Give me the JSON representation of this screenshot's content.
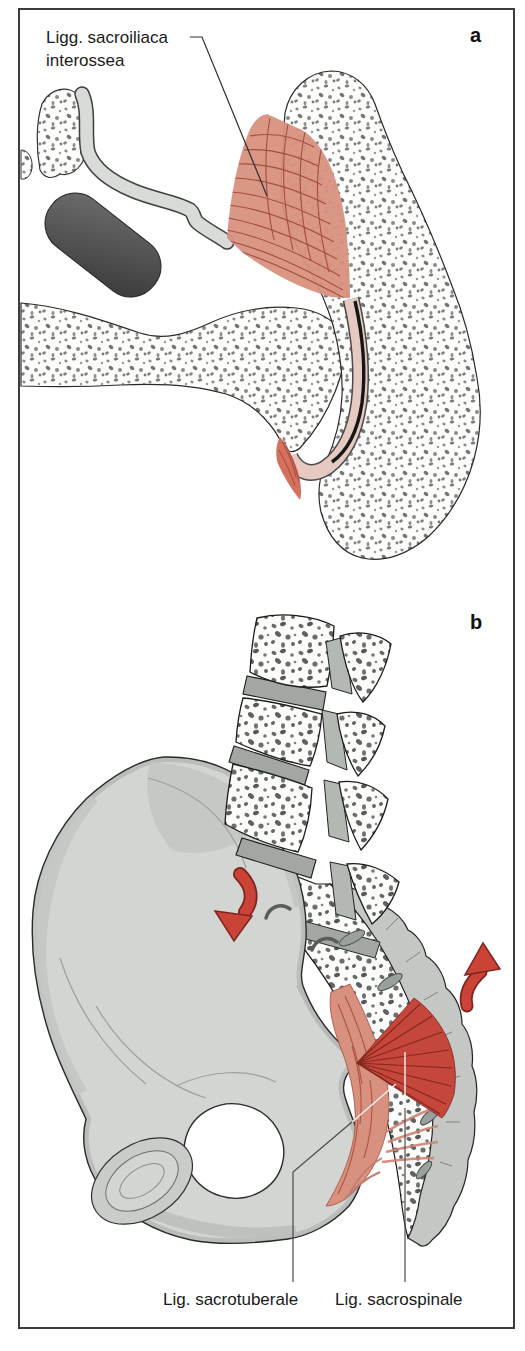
{
  "figure": {
    "panel_a": {
      "marker": "a",
      "ligament_label_line1": "Ligg. sacroiliaca",
      "ligament_label_line2": "interossea"
    },
    "panel_b": {
      "marker": "b",
      "label_sacrotuberale": "Lig. sacrotuberale",
      "label_sacrospinale": "Lig. sacrospinale"
    }
  },
  "colors": {
    "frame_gray": "#3c3c3c",
    "ligament_red": "#c5463a",
    "ligament_pink": "#d8917f",
    "fiber_dark": "#9c4034",
    "cartilage_pink": "#e6c9c1",
    "bone_gray": "#d2d5d2",
    "disc_gray": "#a2a7a2",
    "arrow_red": "#cb4337",
    "outline_dark": "#2a2a2a"
  }
}
